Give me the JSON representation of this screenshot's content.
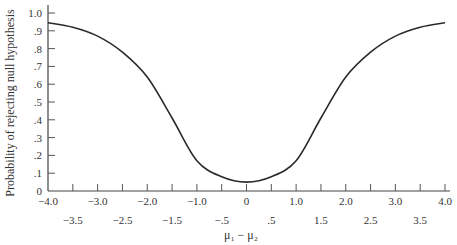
{
  "chart_data": {
    "type": "line",
    "title": "",
    "xlabel": "μ₁ − μ₂",
    "ylabel": "Probability of rejecting null hypothesis",
    "xlim": [
      -4.0,
      4.0
    ],
    "ylim": [
      0,
      1.0
    ],
    "grid": false,
    "legend": null,
    "x_ticks_major": [
      "−4.0",
      "−3.0",
      "−2.0",
      "−1.0",
      "0",
      "1.0",
      "2.0",
      "3.0",
      "4.0"
    ],
    "x_ticks_minor": [
      "−3.5",
      "−2.5",
      "−1.5",
      "−.5",
      ".5",
      "1.5",
      "2.5",
      "3.5"
    ],
    "y_ticks": [
      "0",
      ".1",
      ".2",
      ".3",
      ".4",
      ".5",
      ".6",
      ".7",
      ".8",
      ".9",
      "1.0"
    ],
    "series": [
      {
        "name": "Power curve",
        "x": [
          -4.0,
          -3.5,
          -3.0,
          -2.5,
          -2.0,
          -1.5,
          -1.0,
          -0.5,
          0.0,
          0.5,
          1.0,
          1.5,
          2.0,
          2.5,
          3.0,
          3.5,
          4.0
        ],
        "y": [
          0.945,
          0.92,
          0.87,
          0.78,
          0.64,
          0.41,
          0.17,
          0.08,
          0.05,
          0.08,
          0.17,
          0.41,
          0.64,
          0.78,
          0.87,
          0.92,
          0.945
        ]
      }
    ]
  },
  "axis": {
    "xlabel": "μ₁ − μ₂",
    "ylabel": "Probability of rejecting null hypothesis"
  }
}
